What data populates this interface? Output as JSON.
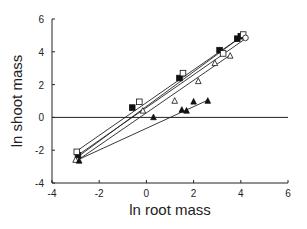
{
  "chart_data": {
    "type": "scatter",
    "title": "",
    "xlabel": "ln root mass",
    "ylabel": "ln shoot mass",
    "xlim": [
      -4,
      6
    ],
    "ylim": [
      -4,
      6
    ],
    "xticks": [
      -4,
      -2,
      0,
      2,
      4,
      6
    ],
    "yticks": [
      -4,
      -2,
      0,
      2,
      4,
      6
    ],
    "grid": false,
    "legend": "none",
    "reference_line": {
      "y": 0
    },
    "series": [
      {
        "name": "filled-square",
        "marker": "square-filled",
        "x": [
          -2.9,
          -0.6,
          1.4,
          3.1,
          3.85,
          4.0
        ],
        "y": [
          -2.3,
          0.6,
          2.4,
          4.1,
          4.8,
          4.95
        ],
        "fit": {
          "x": [
            -2.95,
            4.05
          ],
          "y": [
            -2.45,
            4.95
          ]
        }
      },
      {
        "name": "open-square",
        "marker": "square-open",
        "x": [
          -2.95,
          -0.3,
          1.55,
          3.25,
          4.1
        ],
        "y": [
          -2.1,
          0.95,
          2.7,
          3.9,
          5.05
        ],
        "fit": {
          "x": [
            -2.95,
            4.1
          ],
          "y": [
            -2.05,
            5.0
          ]
        }
      },
      {
        "name": "open-circle",
        "marker": "circle-open",
        "x": [
          4.2
        ],
        "y": [
          4.85
        ],
        "fit": {
          "x": [
            -2.9,
            4.2
          ],
          "y": [
            -2.3,
            4.8
          ]
        }
      },
      {
        "name": "open-triangle",
        "marker": "triangle-open",
        "x": [
          -3.0,
          -0.15,
          1.2,
          2.2,
          2.9,
          3.55
        ],
        "y": [
          -2.6,
          0.4,
          1.0,
          2.2,
          3.3,
          3.75
        ],
        "fit": {
          "x": [
            -2.9,
            3.55
          ],
          "y": [
            -2.6,
            3.8
          ]
        }
      },
      {
        "name": "filled-triangle",
        "marker": "triangle-filled",
        "x": [
          -2.85,
          0.3,
          1.5,
          1.7,
          2.0,
          2.6
        ],
        "y": [
          -2.65,
          0.0,
          0.45,
          0.4,
          0.95,
          1.0
        ],
        "fit": {
          "x": [
            -2.85,
            2.6
          ],
          "y": [
            -2.55,
            1.05
          ]
        }
      }
    ]
  }
}
